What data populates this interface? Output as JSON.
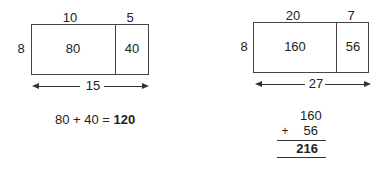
{
  "left_model": {
    "top_labels": [
      "10",
      "5"
    ],
    "side_label": "8",
    "cells": [
      "80",
      "40"
    ],
    "total_width_label": "15",
    "equation": {
      "expression": "80 + 40 = ",
      "result": "120"
    }
  },
  "right_model": {
    "top_labels": [
      "20",
      "7"
    ],
    "side_label": "8",
    "cells": [
      "160",
      "56"
    ],
    "total_width_label": "27",
    "column_addition": {
      "addend1": "160",
      "operator": "+",
      "addend2": "56",
      "sum": "216"
    }
  }
}
